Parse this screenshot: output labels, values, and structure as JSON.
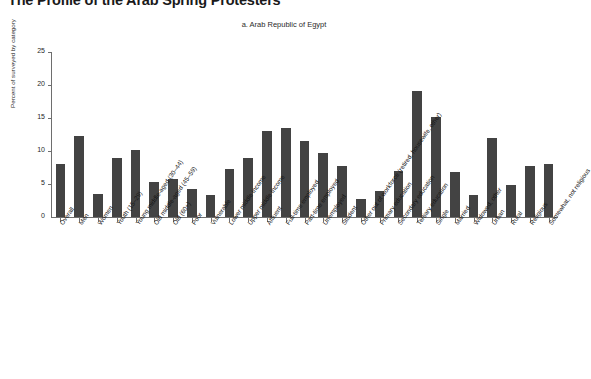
{
  "figure": {
    "title": "The Profile of the Arab Spring Protesters",
    "subtitle": "a. Arab Republic of Egypt"
  },
  "chart_data": {
    "type": "bar",
    "title": "The Profile of the Arab Spring Protesters",
    "subtitle": "a. Arab Republic of Egypt",
    "xlabel": "",
    "ylabel": "Percent of surveyed by category",
    "ylim": [
      0,
      25
    ],
    "yticks": [
      0,
      5,
      10,
      15,
      20,
      25
    ],
    "grid": false,
    "legend": false,
    "bar_color": "#434343",
    "categories": [
      "Overall",
      "Men",
      "Women",
      "Youth (15–29)",
      "Young middle-aged (30–44)",
      "Old middle-aged (45–59)",
      "Old (60+)",
      "Poor",
      "Vulnerable",
      "Lower middle income",
      "Upper middle income",
      "Affluent",
      "Full-time employed",
      "Part-time employed",
      "Unemployed",
      "Student",
      "Other out of workforce (retired, housewife, other)",
      "Primary education",
      "Secondary education",
      "Tertiary education",
      "Single",
      "Married",
      "Widowed, other",
      "Urban",
      "Rural",
      "Religious",
      "Somewhat, not religious"
    ],
    "values": [
      8.1,
      12.3,
      3.5,
      9.0,
      10.2,
      5.3,
      5.8,
      4.2,
      3.3,
      7.2,
      8.9,
      13.0,
      13.5,
      11.5,
      9.7,
      7.8,
      2.7,
      3.9,
      7.0,
      19.1,
      15.2,
      6.8,
      3.3,
      12.0,
      4.9,
      7.8,
      8.0
    ]
  }
}
